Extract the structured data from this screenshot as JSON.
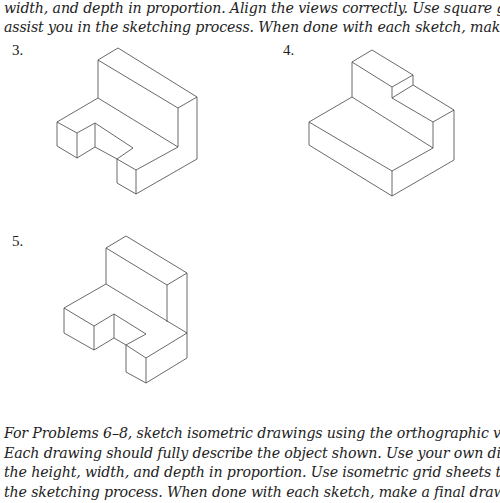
{
  "top_paragraph": {
    "lines": [
      "width, and depth in proportion. Align the views correctly. Use square grid sheets to",
      "assist you in the sketching process. When done with each sketch, make a final drawing."
    ]
  },
  "problems": [
    {
      "number": "3.",
      "figure": "isometric-object-l-shaped-with-notched-base"
    },
    {
      "number": "4.",
      "figure": "isometric-object-stepped-block"
    },
    {
      "number": "5.",
      "figure": "isometric-object-l-shaped-with-notched-base"
    }
  ],
  "bottom_paragraph": {
    "lines": [
      "For Problems 6–8, sketch isometric drawings using the orthographic views shown.",
      "Each drawing should fully describe the object shown. Use your own dimensions. Keep",
      "the height, width, and depth in proportion. Use isometric grid sheets to assist you in",
      "the sketching process. When done with each sketch, make a final drawing."
    ]
  }
}
